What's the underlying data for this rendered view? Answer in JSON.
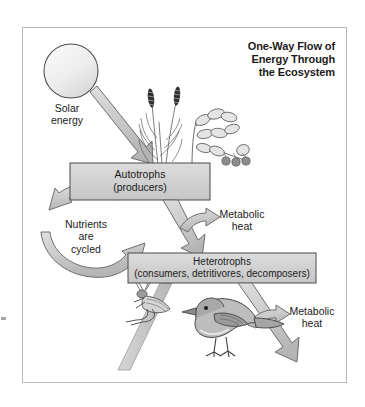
{
  "figure": {
    "title": "One-Way Flow of\nEnergy Through\nthe Ecosystem",
    "background_color": "#ffffff",
    "frame_color": "#b9b9b9"
  },
  "colors": {
    "arrow_fill": "#c9c9c9",
    "arrow_stroke": "#6e6e6e",
    "box_fill": "#d2d2d2",
    "box_stroke": "#4a4a4a",
    "sun_fill": "#ebebeb",
    "sun_stroke": "#555555",
    "text": "#1b1b1b"
  },
  "nodes": [
    {
      "id": "sun",
      "name": "sun",
      "type": "source",
      "label": "Solar\nenergy"
    },
    {
      "id": "autotrophs",
      "name": "autotrophs-box",
      "type": "process-box",
      "label": "Autotrophs\n(producers)",
      "title": "Autotrophs",
      "subtitle": "(producers)"
    },
    {
      "id": "heterotrophs",
      "name": "heterotrophs-box",
      "type": "process-box",
      "label": "Heterotrophs\n(consumers, detritivores, decomposers)",
      "title": "Heterotrophs",
      "subtitle": "(consumers, detritivores, decomposers)"
    }
  ],
  "flows": [
    {
      "id": "solar-to-autotrophs",
      "label": "Solar\nenergy",
      "from": "sun",
      "to": "autotrophs"
    },
    {
      "id": "autotrophs-to-heterotrophs",
      "label": "",
      "from": "autotrophs",
      "to": "heterotrophs"
    },
    {
      "id": "metabolic-heat-upper",
      "label": "Metabolic\nheat",
      "from": "autotrophs",
      "to": "environment"
    },
    {
      "id": "metabolic-heat-lower",
      "label": "Metabolic\nheat",
      "from": "heterotrophs",
      "to": "environment"
    },
    {
      "id": "nutrient-cycle",
      "label": "Nutrients\nare\ncycled",
      "from": "heterotrophs",
      "to": "autotrophs"
    }
  ],
  "labels": {
    "solar_energy": "Solar\nenergy",
    "nutrients_cycled": "Nutrients\nare\ncycled",
    "metabolic_heat_upper": "Metabolic\nheat",
    "metabolic_heat_lower": "Metabolic\nheat",
    "autotrophs_box": "Autotrophs\n(producers)",
    "heterotrophs_box": "Heterotrophs\n(consumers, detritivores, decomposers)"
  },
  "illustrations": [
    {
      "id": "grass",
      "name": "grass-plant-illustration",
      "description": "grass with seed heads"
    },
    {
      "id": "berry-plant",
      "name": "berry-plant-illustration",
      "description": "leafy plant with berries"
    },
    {
      "id": "grasshopper",
      "name": "grasshopper-illustration",
      "description": "grasshopper on stem"
    },
    {
      "id": "bird",
      "name": "bird-illustration",
      "description": "sparrow"
    }
  ]
}
